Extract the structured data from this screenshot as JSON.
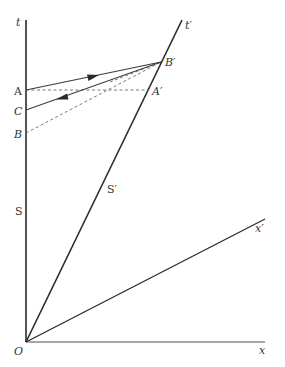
{
  "diagram": {
    "title": "",
    "colors": {
      "axis": "#2a2a2a",
      "xaxis": "#8a8a8a",
      "signal": "#3a3a3a",
      "dashed": "#6a6a6a",
      "label": "#333333",
      "background": "#ffffff"
    },
    "axes": {
      "t": {
        "label": "t"
      },
      "x": {
        "label": "x"
      },
      "t_prime": {
        "label": "t′"
      },
      "x_prime": {
        "label": "x′"
      },
      "origin": {
        "label": "O"
      }
    },
    "worldlines": {
      "S": {
        "label": "S"
      },
      "S_prime": {
        "label": "S′"
      }
    },
    "events": {
      "A": {
        "label": "A"
      },
      "B": {
        "label": "B"
      },
      "C": {
        "label": "C"
      },
      "A_prime": {
        "label": "A′"
      },
      "B_prime": {
        "label": "B′"
      }
    },
    "signals": [
      {
        "from": "A",
        "to": "B′",
        "style": "solid",
        "arrow": "forward"
      },
      {
        "from": "B′",
        "to": "C",
        "style": "solid",
        "arrow": "forward"
      },
      {
        "from": "A",
        "to": "A′",
        "style": "dashed",
        "arrow": "none"
      },
      {
        "from": "B",
        "to": "B′",
        "style": "dashed",
        "arrow": "none"
      },
      {
        "from": "C",
        "to": "B′",
        "style": "dashed",
        "arrow": "none"
      }
    ]
  }
}
